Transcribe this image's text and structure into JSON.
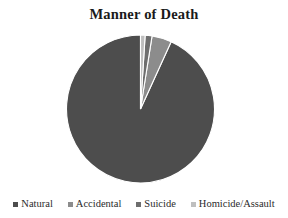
{
  "chart_data": {
    "type": "pie",
    "title": "Manner of Death",
    "categories": [
      "Natural",
      "Accidental",
      "Suicide",
      "Homicide/Assault"
    ],
    "values": [
      93.2,
      4.3,
      1.5,
      1.0
    ],
    "units": "percent",
    "colors": [
      "#4d4d4d",
      "#8c8c8c",
      "#6e6e6e",
      "#bfbfbf"
    ],
    "start_angle_deg": 0,
    "direction": "counterclockwise",
    "legend_position": "bottom",
    "grid": false,
    "labels_shown": false,
    "slice_border_color": "#ffffff"
  },
  "figure": {
    "title": "Manner of Death",
    "background": "#ffffff"
  },
  "legend": {
    "items": [
      {
        "label": "Natural",
        "color": "#4d4d4d"
      },
      {
        "label": "Accidental",
        "color": "#8c8c8c"
      },
      {
        "label": "Suicide",
        "color": "#6e6e6e"
      },
      {
        "label": "Homicide/Assault",
        "color": "#bfbfbf"
      }
    ]
  }
}
